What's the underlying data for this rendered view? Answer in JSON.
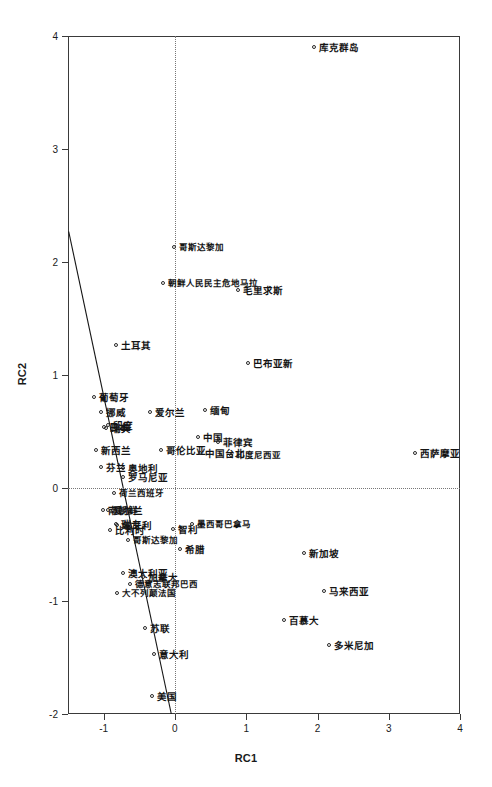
{
  "chart_data": {
    "type": "scatter",
    "title": "",
    "xlabel": "RC1",
    "ylabel": "RC2",
    "xlim": [
      -1.5,
      4.0
    ],
    "ylim": [
      -2.0,
      4.0
    ],
    "xticks": [
      "-1",
      "0",
      "1",
      "2",
      "3",
      "4"
    ],
    "xtick_values": [
      -1,
      0,
      1,
      2,
      3,
      4
    ],
    "yticks": [
      "-2",
      "-1",
      "0",
      "1",
      "2",
      "3",
      "4"
    ],
    "ytick_values": [
      -2,
      -1,
      0,
      1,
      2,
      3,
      4
    ],
    "grid": false,
    "legend": "none",
    "reference_lines": [
      {
        "name": "vertical-zero",
        "axis": "x",
        "value": 0,
        "style": "dotted"
      },
      {
        "name": "horizontal-zero",
        "axis": "y",
        "value": 0,
        "style": "dotted"
      }
    ],
    "fit_line": {
      "name": "loading-axis-line",
      "style": "solid",
      "x1": -1.49,
      "y1": 2.27,
      "x2": -0.05,
      "y2": -2.0
    },
    "point_marker": "open-circle",
    "points": [
      {
        "label": "库克群岛",
        "x": 1.96,
        "y": 3.89
      },
      {
        "label": "哥斯达黎加",
        "x": 0.0,
        "y": 2.12
      },
      {
        "label": "朝鲜人民民主危地马拉",
        "x": -0.15,
        "y": 1.81
      },
      {
        "label": "毛里求斯",
        "x": 0.9,
        "y": 1.74
      },
      {
        "label": "土耳其",
        "x": -0.82,
        "y": 1.26
      },
      {
        "label": "巴布亚新",
        "x": 1.04,
        "y": 1.1
      },
      {
        "label": "葡萄牙",
        "x": -1.12,
        "y": 0.8
      },
      {
        "label": "挪威",
        "x": -1.02,
        "y": 0.66
      },
      {
        "label": "爱尔兰",
        "x": -0.34,
        "y": 0.66
      },
      {
        "label": "缅甸",
        "x": 0.44,
        "y": 0.68
      },
      {
        "label": "印度",
        "x": -0.92,
        "y": 0.55
      },
      {
        "label": "日本",
        "x": -0.98,
        "y": 0.53
      },
      {
        "label": "瑞典",
        "x": -0.95,
        "y": 0.52
      },
      {
        "label": "中国",
        "x": 0.34,
        "y": 0.44
      },
      {
        "label": "菲律宾",
        "x": 0.62,
        "y": 0.4
      },
      {
        "label": "新西兰",
        "x": -1.1,
        "y": 0.33
      },
      {
        "label": "哥伦比亚",
        "x": -0.18,
        "y": 0.33
      },
      {
        "label": "中国台北",
        "x": 0.36,
        "y": 0.3
      },
      {
        "label": "印度尼西亚",
        "x": 0.8,
        "y": 0.28
      },
      {
        "label": "西萨摩亚",
        "x": 3.38,
        "y": 0.3
      },
      {
        "label": "芬兰",
        "x": -1.02,
        "y": 0.18
      },
      {
        "label": "奥地利",
        "x": -0.72,
        "y": 0.17
      },
      {
        "label": "罗马尼亚",
        "x": -0.72,
        "y": 0.09
      },
      {
        "label": "荷兰西班牙",
        "x": -0.84,
        "y": -0.05
      },
      {
        "label": "南朝鲜",
        "x": -1.0,
        "y": -0.2
      },
      {
        "label": "爱尔兰",
        "x": -0.92,
        "y": -0.2
      },
      {
        "label": "瑞士",
        "x": -0.82,
        "y": -0.33
      },
      {
        "label": "匈牙利",
        "x": -0.8,
        "y": -0.34
      },
      {
        "label": "比利时",
        "x": -0.9,
        "y": -0.38
      },
      {
        "label": "智利",
        "x": -0.02,
        "y": -0.37
      },
      {
        "label": "墨西哥巴拿马",
        "x": 0.26,
        "y": -0.33
      },
      {
        "label": "哥斯达黎加",
        "x": -0.64,
        "y": -0.47
      },
      {
        "label": "希腊",
        "x": 0.08,
        "y": -0.55
      },
      {
        "label": "新加坡",
        "x": 1.82,
        "y": -0.58
      },
      {
        "label": "澳大利亚",
        "x": -0.72,
        "y": -0.76
      },
      {
        "label": "加拿大",
        "x": -0.44,
        "y": -0.8
      },
      {
        "label": "德意志联邦巴西",
        "x": -0.62,
        "y": -0.86
      },
      {
        "label": "马来西亚",
        "x": 2.1,
        "y": -0.92
      },
      {
        "label": "大不列颠法国",
        "x": -0.8,
        "y": -0.94
      },
      {
        "label": "百慕大",
        "x": 1.54,
        "y": -1.18
      },
      {
        "label": "苏联",
        "x": -0.41,
        "y": -1.25
      },
      {
        "label": "多米尼加",
        "x": 2.18,
        "y": -1.4
      },
      {
        "label": "意大利",
        "x": -0.28,
        "y": -1.48
      },
      {
        "label": "美国",
        "x": -0.31,
        "y": -1.85
      }
    ]
  }
}
